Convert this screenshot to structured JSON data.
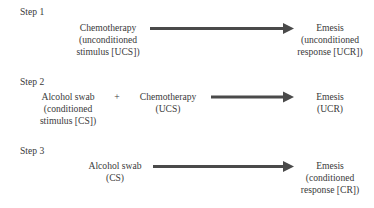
{
  "accent_color": "#4a4a4a",
  "steps": [
    {
      "label": "Step 1",
      "stimuli": [
        {
          "lines": [
            "Chemotherapy",
            "(unconditioned",
            "stimulus [UCS])"
          ]
        }
      ],
      "operator": "",
      "response": {
        "lines": [
          "Emesis",
          "(unconditioned",
          "response [UCR])"
        ]
      }
    },
    {
      "label": "Step 2",
      "stimuli": [
        {
          "lines": [
            "Alcohol swab",
            "(conditioned",
            "stimulus [CS])"
          ]
        },
        {
          "lines": [
            "Chemotherapy",
            "(UCS)"
          ]
        }
      ],
      "operator": "+",
      "response": {
        "lines": [
          "Emesis",
          "(UCR)"
        ]
      }
    },
    {
      "label": "Step 3",
      "stimuli": [
        {
          "lines": [
            "Alcohol swab",
            "(CS)"
          ]
        }
      ],
      "operator": "",
      "response": {
        "lines": [
          "Emesis",
          "(conditioned",
          "response [CR])"
        ]
      }
    }
  ]
}
